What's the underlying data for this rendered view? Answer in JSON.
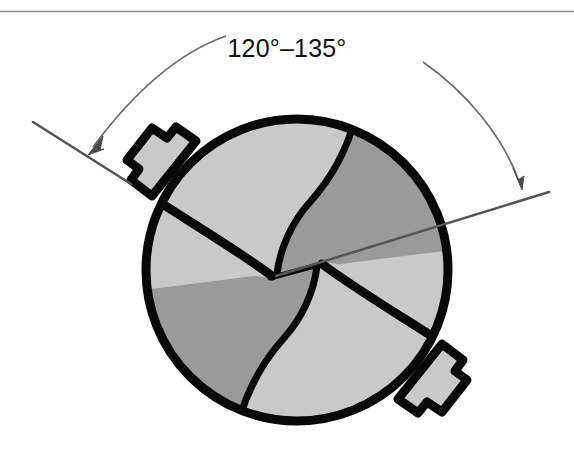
{
  "figure": {
    "name": "drill-point-angle-diagram",
    "kind": "technical-line-drawing",
    "width": 574,
    "height": 454,
    "background_color": "#ffffff"
  },
  "annotation": {
    "angle_label": "120°–135°",
    "angle_min_degrees": 120,
    "angle_max_degrees": 135,
    "label_position": {
      "x": 287,
      "y": 48
    }
  },
  "top_rule": {
    "visible": true,
    "y": 11,
    "x_start": 0,
    "x_end": 574,
    "color": "#8d8d8d",
    "thickness": 1.4
  },
  "colors": {
    "outline": "#080808",
    "face_light": "#c9c9c9",
    "face_dark": "#9a9a9a",
    "leader_line": "#555555",
    "dimension_arc": "#6b6b6b",
    "rule": "#8d8d8d",
    "text": "#111111"
  },
  "drill_body": {
    "name": "drill-point-outline",
    "center": {
      "x": 297,
      "y": 270
    },
    "radius": 155,
    "outline_width": 9,
    "flute_count": 2,
    "chisel_edge": {
      "name": "chisel-edge",
      "x1": 268,
      "y1": 279,
      "x2": 300,
      "y2": 268
    },
    "margins": [
      {
        "name": "margin-notch-upper-left",
        "position": "upper-left"
      },
      {
        "name": "margin-notch-lower-right",
        "position": "lower-right"
      }
    ],
    "surfaces": [
      {
        "name": "flute-face-upper-left",
        "tone": "light"
      },
      {
        "name": "relief-face-upper-right",
        "tone": "dark"
      },
      {
        "name": "relief-face-lower-left",
        "tone": "dark"
      },
      {
        "name": "flute-face-lower-right",
        "tone": "light"
      }
    ]
  },
  "leaders": {
    "left": {
      "name": "leader-line-left",
      "x1": 33,
      "y1": 122,
      "x2": 131,
      "y2": 184,
      "thickness": 2.4
    },
    "right": {
      "name": "leader-line-right",
      "x1": 276,
      "y1": 276,
      "x2": 549,
      "y2": 192,
      "thickness": 2.4
    }
  },
  "dimension_arcs": {
    "left": {
      "name": "dimension-arc-left",
      "start": {
        "x": 226,
        "y": 36
      },
      "end": {
        "x": 89,
        "y": 152
      },
      "arrow_at": "end",
      "arrow_tip": {
        "x": 89,
        "y": 152
      },
      "thickness": 1.6
    },
    "right": {
      "name": "dimension-arc-right",
      "start": {
        "x": 423,
        "y": 62
      },
      "end": {
        "x": 522,
        "y": 187
      },
      "arrow_at": "end",
      "arrow_tip": {
        "x": 522,
        "y": 187
      },
      "thickness": 1.6
    }
  }
}
